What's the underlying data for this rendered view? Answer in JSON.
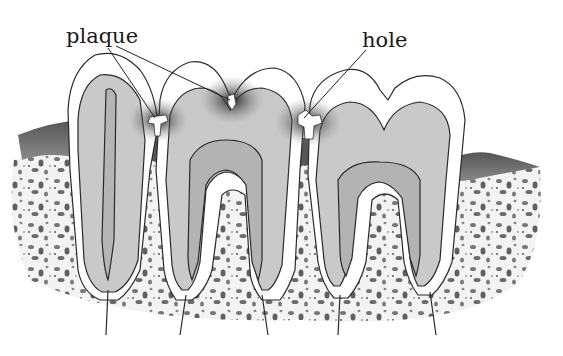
{
  "diagram": {
    "labels": {
      "plaque": "plaque",
      "hole": "hole"
    },
    "colors": {
      "enamel": "#ffffff",
      "dentin": "#c9c9c9",
      "pulp": "#b3b3b3",
      "gum": "#6e6e6e",
      "bone_speckle": "#6a6a6a",
      "outline": "#2a2a2a",
      "decay_shadow": "#222222"
    },
    "teeth": [
      {
        "name": "left-incisor-like tooth",
        "roots": 1
      },
      {
        "name": "middle molar",
        "roots": 2
      },
      {
        "name": "right molar",
        "roots": 2
      }
    ],
    "callouts": [
      {
        "label": "plaque",
        "targets": [
          "gap between tooth 1 and 2",
          "fissure on tooth 2 crown"
        ]
      },
      {
        "label": "hole",
        "targets": [
          "cavity between tooth 2 and 3"
        ]
      }
    ]
  }
}
